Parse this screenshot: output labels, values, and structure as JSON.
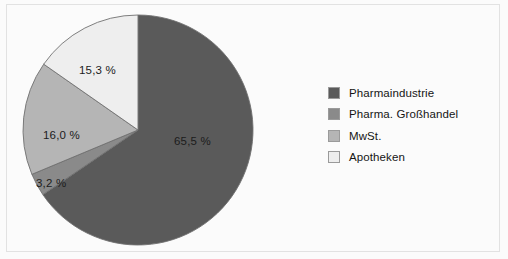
{
  "figure": {
    "background_color": "#fbfbfb",
    "frame_color": "#e2e2e2",
    "label_text_color": "#1c1c1c",
    "legend_text_color": "#151515"
  },
  "chart_data": {
    "type": "pie",
    "title": "",
    "subtitle": "",
    "xlabel": "",
    "ylabel": "",
    "grid": false,
    "legend_position": "right",
    "start_angle_deg": 0,
    "direction": "clockwise",
    "unit": "%",
    "label_format": "german-decimal-comma",
    "categories": [
      "Pharmaindustrie",
      "Pharma. Großhandel",
      "MwSt.",
      "Apotheken"
    ],
    "values": [
      65.5,
      3.2,
      16.0,
      15.3
    ],
    "value_labels": [
      "65,5 %",
      "3,2 %",
      "16,0 %",
      "15,3 %"
    ],
    "colors": [
      "#5a5a5a",
      "#8a8a8a",
      "#b5b5b5",
      "#eeeeee"
    ],
    "slice_edge_color": "#707070",
    "total": 100.0
  },
  "legend": {
    "items": [
      {
        "label": "Pharmaindustrie",
        "color": "#5a5a5a"
      },
      {
        "label": "Pharma. Großhandel",
        "color": "#8a8a8a"
      },
      {
        "label": "MwSt.",
        "color": "#b5b5b5"
      },
      {
        "label": "Apotheken",
        "color": "#eeeeee"
      }
    ]
  }
}
